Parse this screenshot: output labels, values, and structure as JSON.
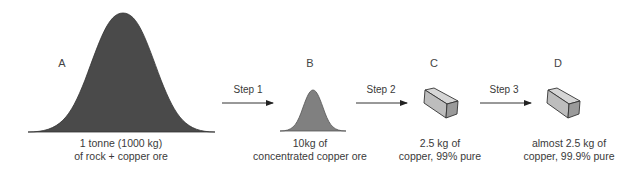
{
  "diagram": {
    "stages": [
      {
        "id": "A",
        "label": "A",
        "caption_line1": "1 tonne (1000 kg)",
        "caption_line2": "of rock + copper ore",
        "shape": "mound-large",
        "color": "#4a4a4a"
      },
      {
        "id": "B",
        "label": "B",
        "caption_line1": "10kg of",
        "caption_line2": "concentrated copper ore",
        "shape": "mound-small",
        "color": "#808080"
      },
      {
        "id": "C",
        "label": "C",
        "caption_line1": "2.5 kg of",
        "caption_line2": "copper, 99% pure",
        "shape": "copper-block",
        "color": "#c8c8c8"
      },
      {
        "id": "D",
        "label": "D",
        "caption_line1": "almost 2.5 kg of",
        "caption_line2": "copper, 99.9% pure",
        "shape": "copper-block",
        "color": "#c8c8c8"
      }
    ],
    "steps": [
      {
        "label": "Step 1",
        "from": "A",
        "to": "B"
      },
      {
        "label": "Step 2",
        "from": "B",
        "to": "C"
      },
      {
        "label": "Step 3",
        "from": "C",
        "to": "D"
      }
    ]
  }
}
